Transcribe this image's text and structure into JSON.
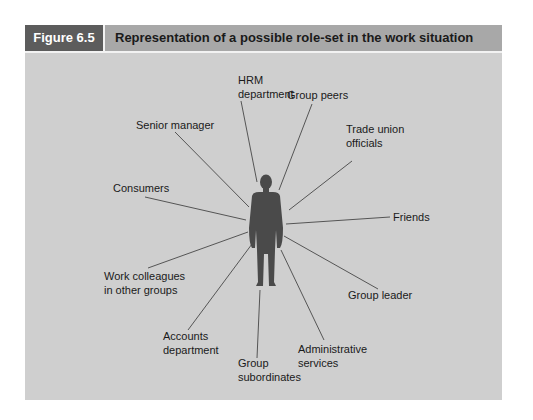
{
  "figure": {
    "number_label": "Figure 6.5",
    "title": "Representation of a possible role-set in the work situation"
  },
  "colors": {
    "panel_bg": "#cfcfcf",
    "header_bg": "#a8a8a8",
    "label_bg": "#5c5c5c",
    "person": "#4a4a4a",
    "line": "#555555"
  },
  "center": {
    "label": "person",
    "icon": "person-silhouette-icon"
  },
  "roles": [
    {
      "id": "hrm",
      "line1": "HRM",
      "line2": "department"
    },
    {
      "id": "group-peers",
      "line1": "Group peers",
      "line2": ""
    },
    {
      "id": "trade-union",
      "line1": "Trade union",
      "line2": "officials"
    },
    {
      "id": "friends",
      "line1": "Friends",
      "line2": ""
    },
    {
      "id": "group-leader",
      "line1": "Group leader",
      "line2": ""
    },
    {
      "id": "admin",
      "line1": "Administrative",
      "line2": "services"
    },
    {
      "id": "subordinates",
      "line1": "Group",
      "line2": "subordinates"
    },
    {
      "id": "accounts",
      "line1": "Accounts",
      "line2": "department"
    },
    {
      "id": "work-colleagues",
      "line1": "Work colleagues",
      "line2": "in other groups"
    },
    {
      "id": "consumers",
      "line1": "Consumers",
      "line2": ""
    },
    {
      "id": "senior-manager",
      "line1": "Senior manager",
      "line2": ""
    }
  ]
}
